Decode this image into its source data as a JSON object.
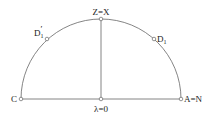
{
  "diagram": {
    "type": "semicircle-geometry",
    "stroke_color": "#666666",
    "point_fill": "#ffffff",
    "labels": {
      "top": "Z=X",
      "left_upper_base": "D",
      "left_upper_sub": "1",
      "left_upper_prime": "′",
      "right_upper_base": "D",
      "right_upper_sub": "1",
      "left": "C",
      "right": "A=N",
      "center": "λ=0"
    },
    "points": [
      {
        "id": "Z",
        "label": "Z=X",
        "x": 101,
        "y": 19
      },
      {
        "id": "D1prime",
        "label": "D1′",
        "x": 47,
        "y": 39
      },
      {
        "id": "D1",
        "label": "D1",
        "x": 154,
        "y": 39
      },
      {
        "id": "C",
        "label": "C",
        "x": 21,
        "y": 99
      },
      {
        "id": "O",
        "label": "λ=0",
        "x": 101,
        "y": 99
      },
      {
        "id": "A",
        "label": "A=N",
        "x": 181,
        "y": 99
      }
    ]
  }
}
